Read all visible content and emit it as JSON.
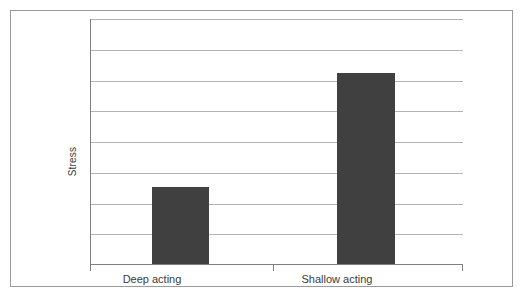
{
  "figure": {
    "background_color": "#ffffff",
    "border_color": "#9a9a9a"
  },
  "axis_title_y": "Stress",
  "chart_data": {
    "type": "bar",
    "title": "",
    "subtitle": "",
    "xlabel": "",
    "ylabel": "Stress",
    "categories": [
      "Deep acting",
      "Shallow acting"
    ],
    "values": [
      2.5,
      6.2
    ],
    "ylim": [
      0,
      8
    ],
    "y_tick_labels": [],
    "x_tick_labels": [
      "Deep acting",
      "Shallow acting"
    ],
    "gridlines": {
      "horizontal": true,
      "vertical": false,
      "count": 8,
      "color": "#b3b3b3"
    },
    "legend": {
      "visible": false,
      "position": "none",
      "entries": []
    },
    "annotations": [],
    "series": [
      {
        "name": "Stress",
        "color": "#404040",
        "values": [
          2.5,
          6.2
        ]
      }
    ],
    "bar_color": "#404040",
    "axis_color": "#7f7f7f",
    "value_axis_labels_visible": false
  }
}
